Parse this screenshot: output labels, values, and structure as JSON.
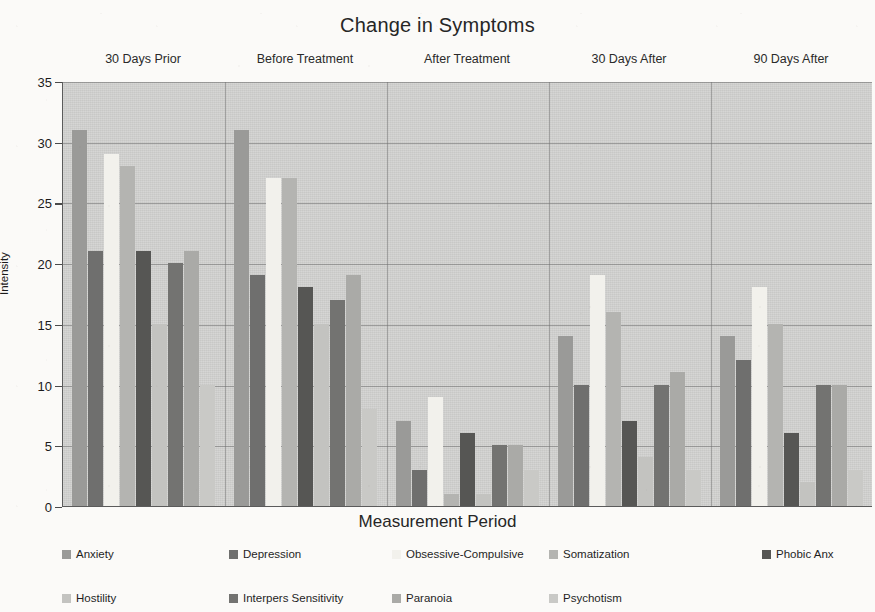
{
  "chart_data": {
    "type": "bar",
    "title": "Change in Symptoms",
    "xlabel": "Measurement Period",
    "ylabel": "Intensity",
    "ylim": [
      0,
      35
    ],
    "ytick_step": 5,
    "yticks": [
      "0",
      "5",
      "10",
      "15",
      "20",
      "25",
      "30",
      "35"
    ],
    "grid": "horizontal",
    "legend_position": "bottom",
    "group_label_position": "top",
    "categories": [
      "30 Days Prior",
      "Before Treatment",
      "After Treatment",
      "30 Days After",
      "90 Days After"
    ],
    "series": [
      {
        "name": "Anxiety",
        "color": "#9a9a98",
        "values": [
          31,
          31,
          7,
          14,
          14
        ]
      },
      {
        "name": "Depression",
        "color": "#6f6f6e",
        "values": [
          21,
          19,
          3,
          10,
          12
        ]
      },
      {
        "name": "Obsessive-Compulsive",
        "color": "#f2f1ec",
        "values": [
          29,
          27,
          9,
          19,
          18
        ]
      },
      {
        "name": "Somatization",
        "color": "#b4b4b1",
        "values": [
          28,
          27,
          1,
          16,
          15
        ]
      },
      {
        "name": "Phobic Anx",
        "color": "#565654",
        "values": [
          21,
          18,
          6,
          7,
          6
        ]
      },
      {
        "name": "Hostility",
        "color": "#c3c3c0",
        "values": [
          15,
          15,
          1,
          4,
          2
        ]
      },
      {
        "name": "Interpers Sensitivity",
        "color": "#737371",
        "values": [
          20,
          17,
          5,
          10,
          10
        ]
      },
      {
        "name": "Paranoia",
        "color": "#aaaaa7",
        "values": [
          21,
          19,
          5,
          11,
          10
        ]
      },
      {
        "name": "Psychotism",
        "color": "#c9c9c6",
        "values": [
          10,
          8,
          3,
          3,
          3
        ]
      }
    ]
  },
  "legend": {
    "rows": [
      [
        "Anxiety",
        "Depression",
        "Obsessive-Compulsive",
        "Somatization",
        "Phobic Anx"
      ],
      [
        "Hostility",
        "Interpers Sensitivity",
        "Paranoia",
        "Psychotism"
      ]
    ]
  }
}
